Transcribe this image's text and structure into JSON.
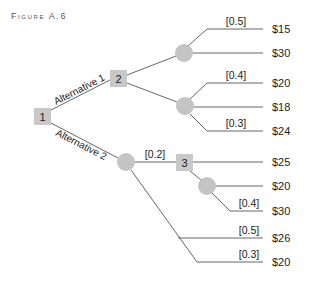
{
  "figure": {
    "title": "Figure A.6"
  },
  "nodes": {
    "decision_1": "1",
    "decision_2": "2",
    "decision_3": "3"
  },
  "alternatives": {
    "alt1": "Alternative 1",
    "alt2": "Alternative 2"
  },
  "probabilities": {
    "p_15": "[0.5]",
    "p_20a": "[0.4]",
    "p_24": "[0.3]",
    "p_node3": "[0.2]",
    "p_30": "[0.4]",
    "p_26": "[0.5]",
    "p_20c": "[0.3]"
  },
  "payoffs": {
    "v1": "$15",
    "v2": "$30",
    "v3": "$20",
    "v4": "$18",
    "v5": "$24",
    "v6": "$25",
    "v7": "$20",
    "v8": "$30",
    "v9": "$26",
    "v10": "$20"
  },
  "colors": {
    "node_fill": "#c8c8c8",
    "line": "#555555",
    "text": "#222222"
  }
}
